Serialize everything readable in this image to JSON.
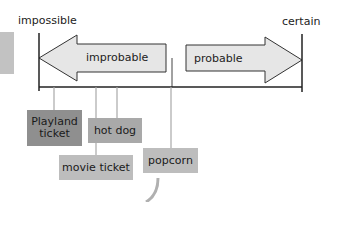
{
  "scale": {
    "left_label": "impossible",
    "right_label": "certain",
    "left_arrow_label": "improbable",
    "right_arrow_label": "probable"
  },
  "items": [
    {
      "label": "Playland ticket",
      "line1": "Playland",
      "line2": "ticket"
    },
    {
      "label": "hot dog"
    },
    {
      "label": "movie ticket"
    },
    {
      "label": "popcorn"
    }
  ],
  "colors": {
    "arrow_fill": "#e6e6e6",
    "line": "#222222",
    "connector": "#a8a8a8",
    "card_dark": "#8f8f8f",
    "card_mid": "#a9a9a9",
    "card_light": "#bdbdbd",
    "side_block": "#bdbdbd"
  }
}
